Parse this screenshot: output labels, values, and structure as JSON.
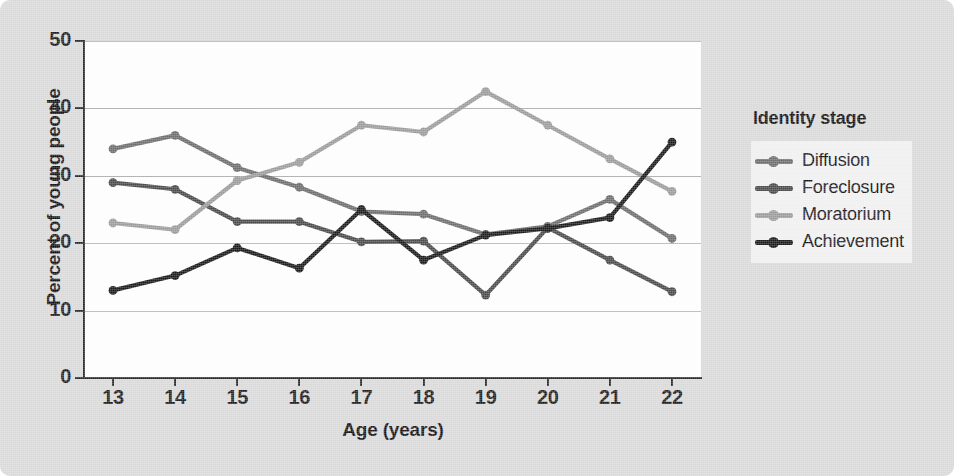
{
  "chart_data": {
    "type": "line",
    "title": "",
    "xlabel": "Age (years)",
    "ylabel": "Percent of young people",
    "x": [
      13,
      14,
      15,
      16,
      17,
      18,
      19,
      20,
      21,
      22
    ],
    "xticklabels": [
      "13",
      "14",
      "15",
      "16",
      "17",
      "18",
      "19",
      "20",
      "21",
      "22"
    ],
    "yticklabels": [
      "0",
      "10",
      "20",
      "30",
      "40",
      "50"
    ],
    "ylim": [
      0,
      50
    ],
    "xlim": [
      13,
      22
    ],
    "yticks": [
      0,
      10,
      20,
      30,
      40,
      50
    ],
    "grid": "horizontal",
    "legend_title": "Identity stage",
    "legend_position": "right",
    "series": [
      {
        "name": "Diffusion",
        "color": "#6d6d6d",
        "values": [
          34.0,
          36.0,
          31.2,
          28.3,
          24.7,
          24.3,
          21.3,
          22.5,
          26.5,
          20.7
        ]
      },
      {
        "name": "Foreclosure",
        "color": "#4a4a4a",
        "values": [
          29.0,
          28.0,
          23.2,
          23.2,
          20.2,
          20.3,
          12.3,
          22.3,
          17.5,
          12.8
        ]
      },
      {
        "name": "Moratorium",
        "color": "#9b9b9b",
        "values": [
          23.0,
          22.0,
          29.3,
          32.0,
          37.5,
          36.5,
          42.5,
          37.5,
          32.5,
          27.7
        ]
      },
      {
        "name": "Achievement",
        "color": "#1a1a1a",
        "values": [
          13.0,
          15.2,
          19.3,
          16.3,
          25.0,
          17.5,
          21.2,
          22.2,
          23.8,
          35.0
        ]
      }
    ]
  }
}
